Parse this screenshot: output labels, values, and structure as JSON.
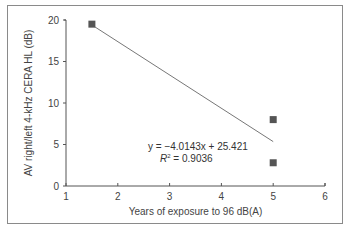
{
  "chart_data": {
    "type": "scatter",
    "title": "",
    "xlabel": "Years of exposure to 96 dB(A)",
    "ylabel": "AV right/left 4-kHz CERA HL (dB)",
    "xlim": [
      1,
      6
    ],
    "ylim": [
      0,
      20
    ],
    "x_ticks": [
      "1",
      "2",
      "3",
      "4",
      "5",
      "6"
    ],
    "y_ticks": [
      "0",
      "5",
      "10",
      "15",
      "20"
    ],
    "grid": false,
    "legend": null,
    "series": [
      {
        "name": "Observations",
        "marker": "square",
        "color": "#555555",
        "points": [
          {
            "x": 1.5,
            "y": 19.5
          },
          {
            "x": 5,
            "y": 8.0
          },
          {
            "x": 5,
            "y": 2.8
          }
        ]
      }
    ],
    "trendline": {
      "type": "linear",
      "slope": -4.0143,
      "intercept": 25.421,
      "x_range": [
        1.5,
        5
      ],
      "color": "#777777"
    },
    "annotations": [
      {
        "text": "y = −4.0143x + 25.421",
        "x": 3.0,
        "y": 5.5
      },
      {
        "text": "R² = 0.9036",
        "x": 3.2,
        "y": 3.8
      }
    ]
  },
  "labels": {
    "equation": "y = −4.0143x + 25.421",
    "r_squared_prefix": "R",
    "r_squared_sup": "2",
    "r_squared_value": " = 0.9036"
  }
}
